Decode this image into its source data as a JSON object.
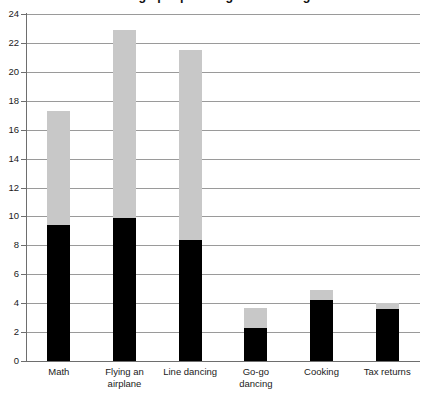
{
  "chart_data": {
    "type": "bar",
    "subtype": "stacked-bar",
    "title": "Things people are good at doing",
    "xlabel": "",
    "ylabel": "",
    "ylim": [
      0,
      24
    ],
    "yticks": [
      0,
      2,
      4,
      6,
      8,
      10,
      12,
      14,
      16,
      18,
      20,
      22,
      24
    ],
    "ytick_labels": [
      "0",
      "2",
      "4",
      "6",
      "8",
      "10",
      "12",
      "14",
      "16",
      "18",
      "20",
      "22",
      "24"
    ],
    "grid": true,
    "legend": "none",
    "categories": [
      "Math",
      "Flying an airplane",
      "Line dancing",
      "Go-go dancing",
      "Cooking",
      "Tax returns"
    ],
    "category_lines": [
      [
        "Math"
      ],
      [
        "Flying an",
        "airplane"
      ],
      [
        "Line dancing"
      ],
      [
        "Go-go",
        "dancing"
      ],
      [
        "Cooking"
      ],
      [
        "Tax returns"
      ]
    ],
    "series": [
      {
        "name": "lower",
        "color": "#000000",
        "values": [
          9.4,
          9.9,
          8.4,
          2.3,
          4.2,
          3.6
        ]
      },
      {
        "name": "upper",
        "color": "#c8c8c8",
        "values": [
          7.9,
          13.0,
          13.1,
          1.4,
          0.7,
          0.4
        ]
      }
    ],
    "totals": [
      17.3,
      22.9,
      21.5,
      3.7,
      4.9,
      4.0
    ]
  },
  "axis_colors": {
    "gridline": "#9a9a9a",
    "axis_line": "#6e6e6e",
    "background": "#ffffff"
  }
}
